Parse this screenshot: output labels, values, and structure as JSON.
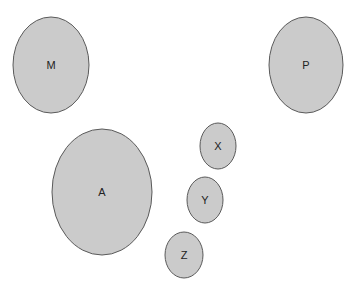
{
  "diagram": {
    "fill_color": "#cbcbcb",
    "stroke_color": "#5a5a5a",
    "nodes": [
      {
        "label": "M",
        "cx": 51,
        "cy": 65,
        "rx": 38,
        "ry": 48
      },
      {
        "label": "P",
        "cx": 306,
        "cy": 65,
        "rx": 37,
        "ry": 48
      },
      {
        "label": "A",
        "cx": 102,
        "cy": 192,
        "rx": 50,
        "ry": 63
      },
      {
        "label": "X",
        "cx": 218,
        "cy": 146,
        "rx": 18,
        "ry": 23
      },
      {
        "label": "Y",
        "cx": 205,
        "cy": 200,
        "rx": 18,
        "ry": 23
      },
      {
        "label": "Z",
        "cx": 184,
        "cy": 255,
        "rx": 19,
        "ry": 23
      }
    ]
  }
}
